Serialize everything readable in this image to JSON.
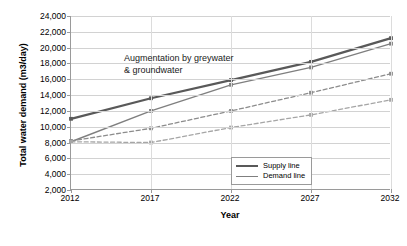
{
  "chart_data": {
    "type": "line",
    "title": "",
    "xlabel": "Year",
    "ylabel": "Total water demand (m3/day)",
    "categories": [
      "2012",
      "2017",
      "2022",
      "2027",
      "2032"
    ],
    "x": [
      2012,
      2017,
      2022,
      2027,
      2032
    ],
    "ylim": [
      2000,
      24000
    ],
    "ytick_labels": [
      "2,000",
      "4,000",
      "6,000",
      "8,000",
      "10,000",
      "12,000",
      "14,000",
      "16,000",
      "18,000",
      "20,000",
      "22,000",
      "24,000"
    ],
    "ytick_values": [
      2000,
      4000,
      6000,
      8000,
      10000,
      12000,
      14000,
      16000,
      18000,
      20000,
      22000,
      24000
    ],
    "grid": true,
    "legend_position": "bottom-right",
    "annotations": [
      {
        "text": "Augmentation by greywater\n& groundwater",
        "x": 2018,
        "y": 19600
      }
    ],
    "series": [
      {
        "name": "Supply line",
        "style": "solid",
        "color": "#595959",
        "width": 2.2,
        "markers": true,
        "values": [
          11000,
          13600,
          15900,
          18200,
          21200
        ]
      },
      {
        "name": "Demand line",
        "style": "solid",
        "color": "#7f7f7f",
        "width": 1.4,
        "markers": true,
        "values": [
          8100,
          12000,
          15300,
          17500,
          20500
        ]
      },
      {
        "name": "Supply line (without augmentation)",
        "style": "dashed",
        "color": "#8c8c8c",
        "width": 1.3,
        "markers": true,
        "values": [
          8200,
          9800,
          12000,
          14300,
          16700
        ]
      },
      {
        "name": "Demand line (without augmentation)",
        "style": "dashed",
        "color": "#a6a6a6",
        "width": 1.3,
        "markers": true,
        "values": [
          8100,
          8000,
          9900,
          11500,
          13400
        ]
      }
    ]
  },
  "legend": {
    "items": [
      {
        "label": "Supply line",
        "color": "#595959",
        "width": 2.6
      },
      {
        "label": "Demand line",
        "color": "#7f7f7f",
        "width": 1.6
      }
    ]
  },
  "colors": {
    "supply": "#595959",
    "demand": "#7f7f7f",
    "dashed_upper": "#8c8c8c",
    "dashed_lower": "#a6a6a6",
    "grid": "#d2d2d2",
    "axis": "#9a9a9a",
    "background": "#ffffff",
    "text": "#000000"
  }
}
